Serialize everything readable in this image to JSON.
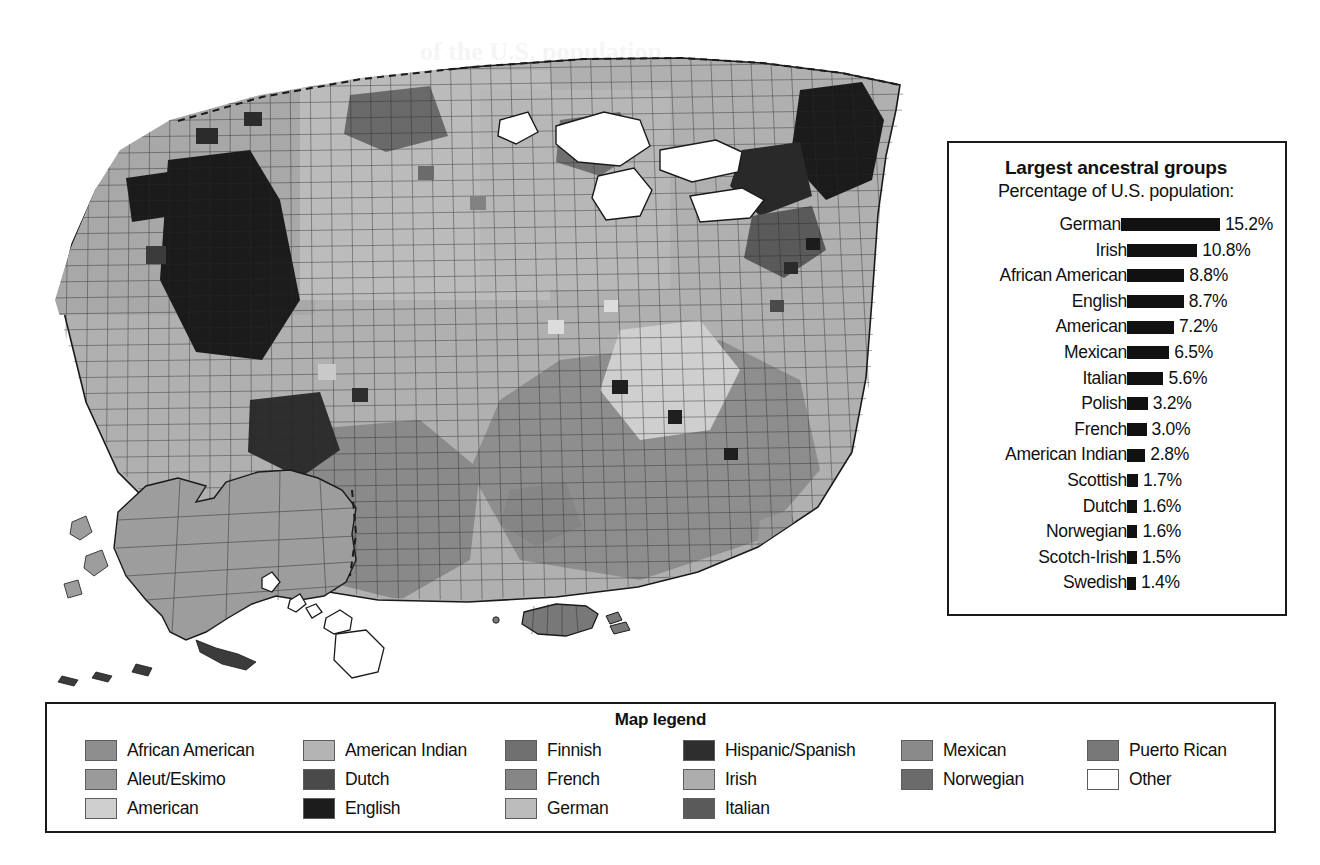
{
  "ancestry_panel": {
    "title": "Largest ancestral groups",
    "subtitle": "Percentage of U.S. population:",
    "value_suffix": "%"
  },
  "map_legend": {
    "title": "Map legend",
    "columns": [
      [
        {
          "label": "African American",
          "color": "#8e8e8e"
        },
        {
          "label": "Aleut/Eskimo",
          "color": "#9a9a9a"
        },
        {
          "label": "American",
          "color": "#cfcfcf"
        }
      ],
      [
        {
          "label": "American Indian",
          "color": "#b4b4b4"
        },
        {
          "label": "Dutch",
          "color": "#4a4a4a"
        },
        {
          "label": "English",
          "color": "#1c1c1c"
        }
      ],
      [
        {
          "label": "Finnish",
          "color": "#707070"
        },
        {
          "label": "French",
          "color": "#868686"
        },
        {
          "label": "German",
          "color": "#bcbcbc"
        }
      ],
      [
        {
          "label": "Hispanic/Spanish",
          "color": "#2e2e2e"
        },
        {
          "label": "Irish",
          "color": "#adadad"
        },
        {
          "label": "Italian",
          "color": "#5a5a5a"
        }
      ],
      [
        {
          "label": "Mexican",
          "color": "#8a8a8a"
        },
        {
          "label": "Norwegian",
          "color": "#6b6b6b"
        }
      ],
      [
        {
          "label": "Puerto Rican",
          "color": "#787878"
        },
        {
          "label": "Other",
          "color": "#ffffff"
        }
      ]
    ]
  },
  "chart_data": {
    "type": "bar",
    "title": "Largest ancestral groups",
    "subtitle": "Percentage of U.S. population:",
    "xlabel": "Percentage of U.S. population",
    "ylabel": "",
    "orientation": "horizontal",
    "grid": false,
    "legend": "none",
    "xlim": [
      0,
      15.2
    ],
    "categories": [
      "German",
      "Irish",
      "African American",
      "English",
      "American",
      "Mexican",
      "Italian",
      "Polish",
      "French",
      "American Indian",
      "Scottish",
      "Dutch",
      "Norwegian",
      "Scotch-Irish",
      "Swedish"
    ],
    "values": [
      15.2,
      10.8,
      8.8,
      8.7,
      7.2,
      6.5,
      5.6,
      3.2,
      3.0,
      2.8,
      1.7,
      1.6,
      1.6,
      1.5,
      1.4
    ],
    "value_labels": [
      "15.2%",
      "10.8%",
      "8.8%",
      "8.7%",
      "7.2%",
      "6.5%",
      "5.6%",
      "3.2%",
      "3.0%",
      "2.8%",
      "1.7%",
      "1.6%",
      "1.6%",
      "1.5%",
      "1.4%"
    ],
    "bar_color": "#111111",
    "rows": [
      {
        "label": "German",
        "value": 15.2,
        "value_label": "15.2%"
      },
      {
        "label": "Irish",
        "value": 10.8,
        "value_label": "10.8%"
      },
      {
        "label": "African American",
        "value": 8.8,
        "value_label": "8.8%"
      },
      {
        "label": "English",
        "value": 8.7,
        "value_label": "8.7%"
      },
      {
        "label": "American",
        "value": 7.2,
        "value_label": "7.2%"
      },
      {
        "label": "Mexican",
        "value": 6.5,
        "value_label": "6.5%"
      },
      {
        "label": "Italian",
        "value": 5.6,
        "value_label": "5.6%"
      },
      {
        "label": "Polish",
        "value": 3.2,
        "value_label": "3.2%"
      },
      {
        "label": "French",
        "value": 3.0,
        "value_label": "3.0%"
      },
      {
        "label": "American Indian",
        "value": 2.8,
        "value_label": "2.8%"
      },
      {
        "label": "Scottish",
        "value": 1.7,
        "value_label": "1.7%"
      },
      {
        "label": "Dutch",
        "value": 1.6,
        "value_label": "1.6%"
      },
      {
        "label": "Norwegian",
        "value": 1.6,
        "value_label": "1.6%"
      },
      {
        "label": "Scotch-Irish",
        "value": 1.5,
        "value_label": "1.5%"
      },
      {
        "label": "Swedish",
        "value": 1.4,
        "value_label": "1.4%"
      }
    ]
  }
}
